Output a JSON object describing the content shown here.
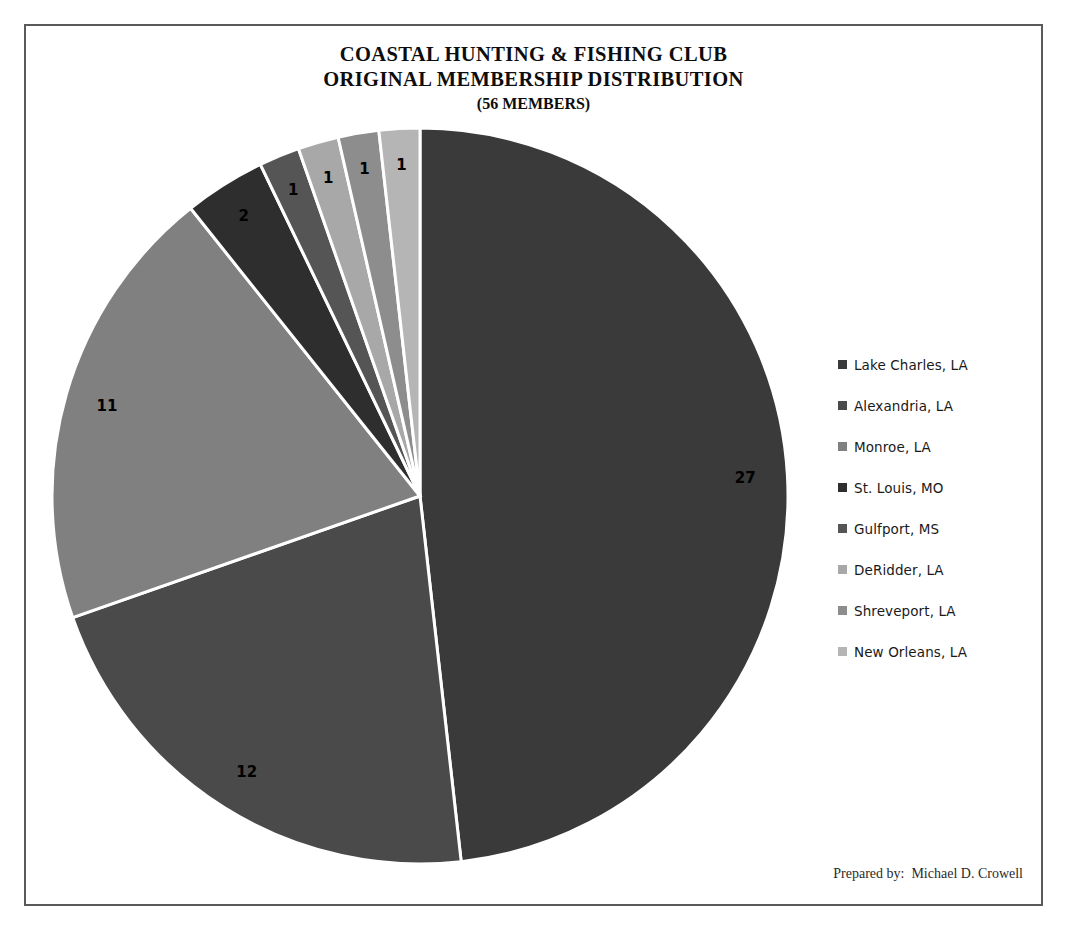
{
  "title": {
    "line1": "COASTAL HUNTING & FISHING CLUB",
    "line2": "ORIGINAL MEMBERSHIP DISTRIBUTION",
    "line3": "(56 MEMBERS)"
  },
  "footer": {
    "credit": "Prepared by:  Michael D. Crowell"
  },
  "legend": {
    "items": [
      {
        "label": "Lake Charles, LA",
        "color": "#3a3a3a"
      },
      {
        "label": "Alexandria, LA",
        "color": "#4a4a4a"
      },
      {
        "label": "Monroe, LA",
        "color": "#808080"
      },
      {
        "label": "St. Louis, MO",
        "color": "#2e2e2e"
      },
      {
        "label": "Gulfport, MS",
        "color": "#555555"
      },
      {
        "label": "DeRidder, LA",
        "color": "#a8a8a8"
      },
      {
        "label": "Shreveport, LA",
        "color": "#8d8d8d"
      },
      {
        "label": "New Orleans, LA",
        "color": "#b5b5b5"
      }
    ]
  },
  "chart_data": {
    "type": "pie",
    "title": "COASTAL HUNTING & FISHING CLUB ORIGINAL MEMBERSHIP DISTRIBUTION (56 MEMBERS)",
    "total": 56,
    "total_label": "56 MEMBERS",
    "start_angle_deg": 0,
    "direction": "clockwise",
    "legend_position": "right",
    "grid": false,
    "categories": [
      "Lake Charles, LA",
      "Alexandria, LA",
      "Monroe, LA",
      "St. Louis, MO",
      "Gulfport, MS",
      "DeRidder, LA",
      "Shreveport, LA",
      "New Orleans, LA"
    ],
    "values": [
      27,
      12,
      11,
      2,
      1,
      1,
      1,
      1
    ],
    "data_labels": [
      "27",
      "12",
      "11",
      "2",
      "1",
      "1",
      "1",
      "1"
    ],
    "colors": [
      "#3a3a3a",
      "#4a4a4a",
      "#808080",
      "#2e2e2e",
      "#555555",
      "#a8a8a8",
      "#8d8d8d",
      "#b5b5b5"
    ],
    "slice_border_color": "#ffffff"
  }
}
